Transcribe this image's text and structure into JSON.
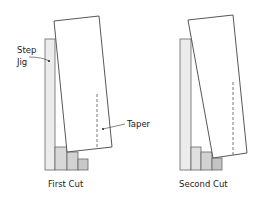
{
  "diagrams": [
    {
      "caption": "First Cut",
      "labels": {
        "jig": [
          "Step",
          "Jig"
        ],
        "taper": "Taper"
      }
    },
    {
      "caption": "Second Cut"
    }
  ],
  "colors": {
    "jig_fill": "#ececec",
    "step_fill": "#d6d6d6",
    "step_fill_dark": "#c8c8c8",
    "outline": "#555555",
    "board_fill": "#ffffff"
  }
}
